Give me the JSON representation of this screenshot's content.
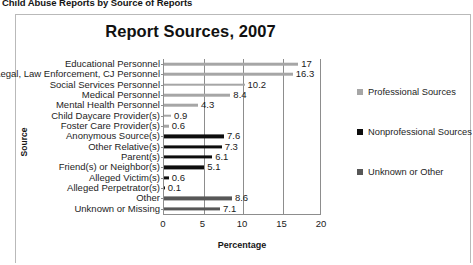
{
  "document": {
    "header": "Child Abuse Reports by Source of Reports"
  },
  "chart_data": {
    "type": "bar",
    "orientation": "horizontal",
    "title": "Report Sources, 2007",
    "xlabel": "Percentage",
    "ylabel": "Source",
    "xlim": [
      0,
      20
    ],
    "xticks": [
      "0",
      "5",
      "10",
      "15",
      "20"
    ],
    "grid": true,
    "legend_position": "right",
    "categories": [
      "Educational Personnel",
      "Legal, Law Enforcement, CJ Personnel",
      "Social Services Personnel",
      "Medical Personnel",
      "Mental Health Personnel",
      "Child Daycare Provider(s)",
      "Foster Care Provider(s)",
      "Anonymous Source(s)",
      "Other Relative(s)",
      "Parent(s)",
      "Friend(s) or Neighbor(s)",
      "Alleged Victim(s)",
      "Alleged Perpetrator(s)",
      "Other",
      "Unknown or Missing"
    ],
    "values": [
      17,
      16.3,
      10.2,
      8.4,
      4.3,
      0.9,
      0.6,
      7.6,
      7.3,
      6.1,
      5.1,
      0.6,
      0.1,
      8.6,
      7.1
    ],
    "value_labels": [
      "17",
      "16.3",
      "10.2",
      "8.4",
      "4.3",
      "0.9",
      "0.6",
      "7.6",
      "7.3",
      "6.1",
      "5.1",
      "0.6",
      "0.1",
      "8.6",
      "7.1"
    ],
    "group_of_category": [
      0,
      0,
      0,
      0,
      0,
      0,
      0,
      1,
      1,
      1,
      1,
      1,
      1,
      2,
      2
    ],
    "legend": [
      {
        "label": "Professional Sources",
        "color": "#a6a6a6"
      },
      {
        "label": "Nonprofessional Sources",
        "color": "#0d0d0d"
      },
      {
        "label": "Unknown or Other",
        "color": "#575757"
      }
    ],
    "annotations": [
      {
        "text": "0",
        "note": "stray overlapping mark near Parent(s) bar origin"
      }
    ]
  }
}
